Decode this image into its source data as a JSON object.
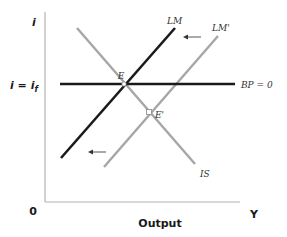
{
  "diagram": {
    "type": "IS-LM-BP",
    "y_axis_label": "i",
    "x_axis_label": "Y",
    "x_axis_title": "Output",
    "origin_label": "0",
    "level_label": "i = i",
    "level_subscript": "f",
    "curves": {
      "lm": {
        "label": "LM",
        "color": "#1a1a1a"
      },
      "lm_prime": {
        "label": "LM'",
        "color": "#a6a6a6"
      },
      "is": {
        "label": "IS",
        "color": "#a6a6a6"
      },
      "bp": {
        "label": "BP = 0",
        "color": "#1a1a1a"
      }
    },
    "points": {
      "e": {
        "label": "E"
      },
      "e_prime": {
        "label": "E'"
      }
    },
    "arrows": [
      {
        "name": "shift-arrow-top",
        "direction": "left"
      },
      {
        "name": "shift-arrow-bottom",
        "direction": "left"
      }
    ],
    "colors": {
      "axis": "#b3b3b3",
      "dark_line": "#1a1a1a",
      "light_line": "#a6a6a6",
      "arrow": "#555555"
    }
  }
}
